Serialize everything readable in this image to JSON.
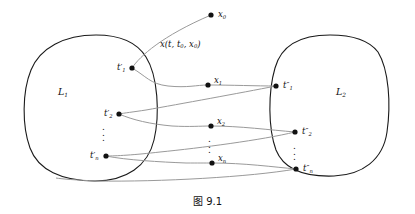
{
  "figure": {
    "caption": "图 9.1",
    "regions": [
      {
        "id": "L1",
        "label": "L",
        "sub": "1",
        "x": 62,
        "y": 92
      },
      {
        "id": "L2",
        "label": "L",
        "sub": "2",
        "x": 340,
        "y": 92
      }
    ],
    "trajectory_label": {
      "text": "x(t, t",
      "sub1": "0",
      "mid": ", x",
      "sub2": "0",
      "close": ")",
      "x": 164,
      "y": 45
    },
    "points": [
      {
        "id": "x0",
        "label": "x",
        "prime": "",
        "sub": "0",
        "cx": 211,
        "cy": 15,
        "label_dx": 7,
        "label_dy": -1,
        "side": "right"
      },
      {
        "id": "t1p",
        "label": "t",
        "prime": "′",
        "sub": "1",
        "cx": 132,
        "cy": 68,
        "label_dx": -15,
        "label_dy": -1,
        "side": "left"
      },
      {
        "id": "t2p",
        "label": "t",
        "prime": "′",
        "sub": "2",
        "cx": 119,
        "cy": 114,
        "label_dx": -15,
        "label_dy": -1,
        "side": "left"
      },
      {
        "id": "tnp",
        "label": "t",
        "prime": "′",
        "sub": "n",
        "cx": 106,
        "cy": 156,
        "label_dx": -15,
        "label_dy": -1,
        "side": "left"
      },
      {
        "id": "x1",
        "label": "x",
        "prime": "",
        "sub": "1",
        "cx": 208,
        "cy": 85,
        "label_dx": 6,
        "label_dy": -9,
        "side": "right"
      },
      {
        "id": "x2",
        "label": "x",
        "prime": "",
        "sub": "2",
        "cx": 211,
        "cy": 126,
        "label_dx": 6,
        "label_dy": -9,
        "side": "right"
      },
      {
        "id": "xn",
        "label": "x",
        "prime": "",
        "sub": "n",
        "cx": 212,
        "cy": 163,
        "label_dx": 6,
        "label_dy": -9,
        "side": "right"
      },
      {
        "id": "t1pp",
        "label": "t",
        "prime": "″",
        "sub": "1",
        "cx": 276,
        "cy": 86,
        "label_dx": 6,
        "label_dy": -1,
        "side": "right"
      },
      {
        "id": "t2pp",
        "label": "t",
        "prime": "″",
        "sub": "2",
        "cx": 295,
        "cy": 132,
        "label_dx": 6,
        "label_dy": -1,
        "side": "right"
      },
      {
        "id": "tnpp",
        "label": "t",
        "prime": "″",
        "sub": "n",
        "cx": 296,
        "cy": 169,
        "label_dx": 6,
        "label_dy": -1,
        "side": "right"
      }
    ],
    "ellipsis_marks": [
      {
        "id": "dots-left",
        "x": 106,
        "y": 131
      },
      {
        "id": "dots-middle",
        "x": 212,
        "y": 143
      },
      {
        "id": "dots-right",
        "x": 297,
        "y": 150
      }
    ],
    "colors": {
      "outline": "#1a1a1a",
      "trajectory": "#9a9a9a",
      "point": "#111111",
      "text": "#111111",
      "background": "#ffffff"
    }
  }
}
